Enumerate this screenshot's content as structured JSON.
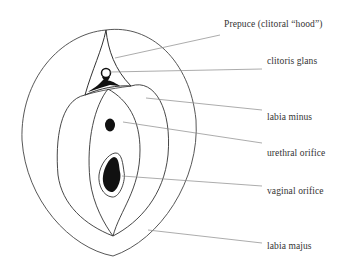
{
  "diagram": {
    "type": "anatomical line drawing",
    "labels": [
      {
        "id": "prepuce",
        "text": "Prepuce (clitoral “hood”)",
        "x": 224,
        "y": 19
      },
      {
        "id": "clitoris-glans",
        "text": "clitoris glans",
        "x": 267,
        "y": 56
      },
      {
        "id": "labia-minus",
        "text": "labia minus",
        "x": 267,
        "y": 112
      },
      {
        "id": "urethral-orifice",
        "text": "urethral orifice",
        "x": 267,
        "y": 148
      },
      {
        "id": "vaginal-orifice",
        "text": "vaginal orifice",
        "x": 267,
        "y": 186
      },
      {
        "id": "labia-majus",
        "text": "labia majus",
        "x": 267,
        "y": 241
      }
    ],
    "colors": {
      "line": "#333333",
      "leader": "#888888",
      "fill": "#111111",
      "text": "#333333"
    }
  }
}
